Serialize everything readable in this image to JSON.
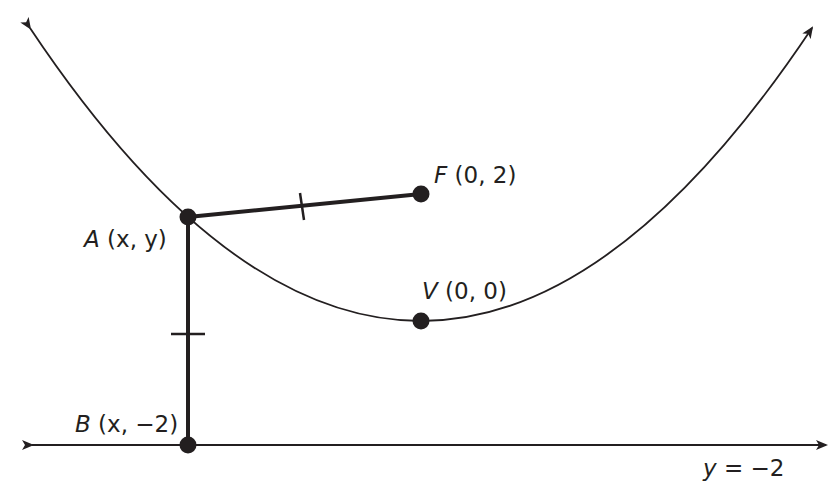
{
  "diagram": {
    "type": "parabola-focus-directrix",
    "curve": {
      "name": "parabola",
      "vertex": [
        0,
        0
      ],
      "opens": "up"
    },
    "points": {
      "A": {
        "letter": "A",
        "coords": " (x, y)",
        "x_var": "x",
        "y_var": "y"
      },
      "F": {
        "letter": "F",
        "coords": " (0, 2)"
      },
      "V": {
        "letter": "V",
        "coords": " (0, 0)"
      },
      "B": {
        "letter": "B",
        "coords": " (x, −2)"
      }
    },
    "directrix": {
      "label": "y = −2",
      "var": "y",
      "rest": " = −2"
    },
    "segments": [
      {
        "from": "A",
        "to": "F",
        "tick_marks": 1
      },
      {
        "from": "A",
        "to": "B",
        "tick_marks": 1
      }
    ],
    "colors": {
      "ink": "#231f20",
      "background": "#ffffff"
    }
  }
}
